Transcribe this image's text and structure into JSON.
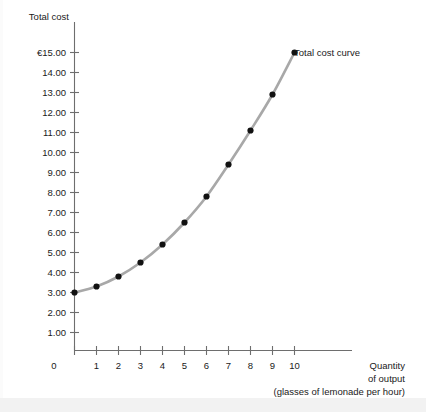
{
  "chart_data": {
    "type": "line",
    "title": "",
    "ylabel": "Total cost",
    "xlabel": "Quantity of output",
    "xlabel_line1": "Quantity",
    "xlabel_line2": "of output",
    "xlabel_line3": "(glasses of lemonade per hour)",
    "series_label": "Total cost curve",
    "currency_symbol": "€",
    "x": [
      0,
      1,
      2,
      3,
      4,
      5,
      6,
      7,
      8,
      9,
      10
    ],
    "values": [
      3.0,
      3.3,
      3.8,
      4.5,
      5.4,
      6.5,
      7.8,
      9.4,
      11.1,
      12.9,
      15.0
    ],
    "series": [
      {
        "name": "Total cost curve",
        "values": [
          3.0,
          3.3,
          3.8,
          4.5,
          5.4,
          6.5,
          7.8,
          9.4,
          11.1,
          12.9,
          15.0
        ]
      }
    ],
    "xlim": [
      0,
      10
    ],
    "ylim": [
      0,
      15
    ],
    "grid": false,
    "legend_position": "inline-end-of-curve",
    "xticks": [
      "0",
      "1",
      "2",
      "3",
      "4",
      "5",
      "6",
      "7",
      "8",
      "9",
      "10"
    ],
    "yticks": [
      "€15.00",
      "14.00",
      "13.00",
      "12.00",
      "11.00",
      "10.00",
      "9.00",
      "8.00",
      "7.00",
      "6.00",
      "5.00",
      "4.00",
      "3.00",
      "2.00",
      "1.00"
    ],
    "ytick_values": [
      15,
      14,
      13,
      12,
      11,
      10,
      9,
      8,
      7,
      6,
      5,
      4,
      3,
      2,
      1
    ],
    "curve_color": "#a8a8a8",
    "marker_color": "#111111",
    "axis_color": "#6e6e6e",
    "text_color": "#1a1a1a",
    "background_color": "#ffffff"
  }
}
